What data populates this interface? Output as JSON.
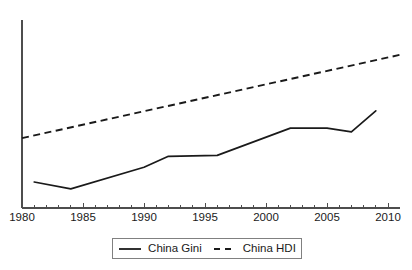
{
  "chart_data": {
    "type": "line",
    "title": "",
    "subtitle": "",
    "xlabel": "",
    "ylabel": "",
    "xlim": [
      1980,
      2010
    ],
    "ylim": [
      0.2,
      0.8
    ],
    "grid": false,
    "legend_position": "bottom-center",
    "x_tick_labels": [
      "1980",
      "1985",
      "1990",
      "1995",
      "2000",
      "2005",
      "2010"
    ],
    "x_tick_values": [
      1980,
      1985,
      1990,
      1995,
      2000,
      2005,
      2010
    ],
    "x_minor_tick_values": [
      1980,
      1981,
      1982,
      1983,
      1984,
      1985,
      1986,
      1987,
      1988,
      1989,
      1990,
      1991,
      1992,
      1993,
      1994,
      1995,
      1996,
      1997,
      1998,
      1999,
      2000,
      2001,
      2002,
      2003,
      2004,
      2005,
      2006,
      2007,
      2008,
      2009,
      2010
    ],
    "y_tick_labels": [],
    "y_axis_visible": true,
    "x_axis_visible": true,
    "series": [
      {
        "name": "China Gini",
        "style": "solid",
        "color": "#1a1a1a",
        "x": [
          1981,
          1984,
          1990,
          1992,
          1996,
          2002,
          2005,
          2007,
          2009
        ],
        "values": [
          0.283,
          0.261,
          0.33,
          0.365,
          0.368,
          0.455,
          0.455,
          0.443,
          0.51
        ]
      },
      {
        "name": "China HDI",
        "style": "dashed",
        "color": "#1a1a1a",
        "x": [
          1980,
          2011
        ],
        "values": [
          0.423,
          0.689
        ]
      }
    ],
    "legend": [
      {
        "label": "China Gini",
        "style": "solid"
      },
      {
        "label": "China HDI",
        "style": "dashed"
      }
    ]
  }
}
